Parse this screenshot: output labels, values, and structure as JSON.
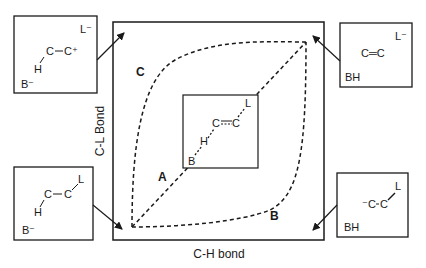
{
  "axes": {
    "x_label": "C-H bond",
    "y_label": "C-L Bond"
  },
  "paths": [
    {
      "id": "A",
      "label": "A"
    },
    {
      "id": "B",
      "label": "B"
    },
    {
      "id": "C",
      "label": "C"
    }
  ],
  "center_box": {
    "B": "B",
    "H": "H",
    "C1": "C",
    "C2": "C",
    "L": "L"
  },
  "corner_boxes": {
    "top_left": {
      "base": "B⁻",
      "leaving": "L⁻",
      "H": "H",
      "C1": "C",
      "C2": "C⁺"
    },
    "top_right": {
      "base": "BH",
      "leaving": "L⁻",
      "alkene": "C═C"
    },
    "bottom_left": {
      "base": "B⁻",
      "H": "H",
      "C1": "C",
      "C2": "C",
      "L": "L"
    },
    "bottom_right": {
      "base": "BH",
      "C1": "⁻C",
      "C2": "C",
      "L": "L"
    }
  }
}
